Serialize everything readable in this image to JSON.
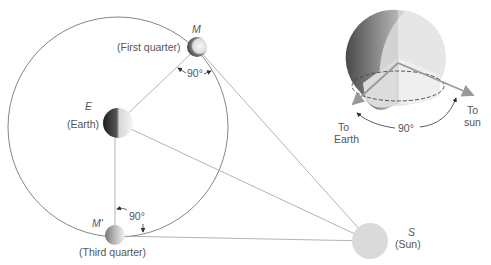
{
  "diagram": {
    "orbit": {
      "cx": 118,
      "cy": 127,
      "r": 110,
      "color": "#777777"
    },
    "earth": {
      "symbol": "E",
      "label": "(Earth)",
      "cx": 118,
      "cy": 123,
      "r": 15
    },
    "moon_first": {
      "symbol": "M",
      "label": "(First quarter)",
      "cx": 197,
      "cy": 48,
      "r": 10
    },
    "moon_third": {
      "symbol": "M'",
      "label": "(Third quarter)",
      "cx": 115,
      "cy": 236,
      "r": 10
    },
    "sun": {
      "symbol": "S",
      "label": "(Sun)",
      "cx": 370,
      "cy": 241,
      "r": 18,
      "color": "#d8d8d8"
    },
    "angle_first": "90°",
    "angle_third": "90°",
    "inset": {
      "to_earth_label_1": "To",
      "to_earth_label_2": "Earth",
      "to_sun_label_1": "To",
      "to_sun_label_2": "sun",
      "angle": "90°"
    },
    "line_color": "#aaaaaa"
  }
}
